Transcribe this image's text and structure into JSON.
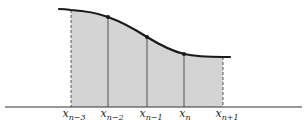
{
  "diagram": {
    "type": "area-under-curve",
    "colors": {
      "fill": "#d4d4d4",
      "curve": "#1a1a1a",
      "axis": "#333333"
    },
    "points": [
      {
        "id": "x_n-3",
        "label_base": "x",
        "label_sub": "n−3",
        "line": "dashed",
        "marker": false
      },
      {
        "id": "x_n-2",
        "label_base": "x",
        "label_sub": "n−2",
        "line": "solid",
        "marker": true
      },
      {
        "id": "x_n-1",
        "label_base": "x",
        "label_sub": "n−1",
        "line": "solid",
        "marker": true
      },
      {
        "id": "x_n",
        "label_base": "x",
        "label_sub": "n",
        "line": "solid",
        "marker": true
      },
      {
        "id": "x_n+1",
        "label_base": "x",
        "label_sub": "n+1",
        "line": "dashed",
        "marker": false
      }
    ]
  }
}
